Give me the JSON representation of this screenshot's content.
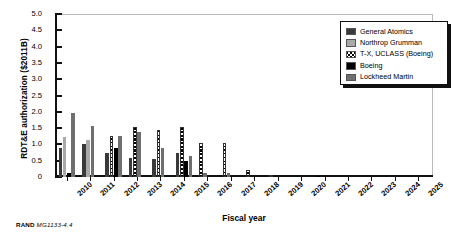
{
  "figure": {
    "caption_prefix": "RAND",
    "caption_id": "MG1133-4.4"
  },
  "legend": {
    "position": "top-right",
    "items": [
      {
        "label": "General Atomics",
        "fill": "dark-gray",
        "color": "#3a3a3a"
      },
      {
        "label": "Northrop Grumman",
        "fill": "light-gray",
        "color": "#a9a9a9"
      },
      {
        "label": "T-X, UCLASS (Boeing)",
        "fill": "crosshatch",
        "color": "#ffffff"
      },
      {
        "label": "Boeing",
        "fill": "black",
        "color": "#000000"
      },
      {
        "label": "Lockheed Martin",
        "fill": "mid-gray",
        "color": "#6f6f6f"
      }
    ]
  },
  "chart_data": {
    "type": "bar",
    "title": "",
    "xlabel": "Fiscal year",
    "ylabel": "RDT&E authorization ($2011B)",
    "ylim": [
      0,
      5.0
    ],
    "yticks": [
      "0",
      "0.5",
      "1.0",
      "1.5",
      "2.0",
      "2.5",
      "3.0",
      "3.5",
      "4.0",
      "4.5",
      "5.0"
    ],
    "grid": false,
    "legend_position": "upper right",
    "categories": [
      "2010",
      "2011",
      "2012",
      "2013",
      "2014",
      "2015",
      "2016",
      "2017",
      "2018",
      "2019",
      "2020",
      "2021",
      "2022",
      "2023",
      "2024",
      "2025"
    ],
    "series": [
      {
        "name": "General Atomics",
        "values": [
          0.88,
          1.02,
          0.75,
          0.59,
          0.55,
          0.75,
          0.0,
          0.0,
          0.0,
          0.0,
          0.0,
          0.0,
          0.0,
          0.0,
          0.0,
          0.0
        ]
      },
      {
        "name": "Northrop Grumman",
        "values": [
          1.22,
          1.13,
          0.0,
          0.0,
          0.0,
          0.0,
          0.0,
          0.0,
          0.0,
          0.0,
          0.0,
          0.0,
          0.0,
          0.0,
          0.0,
          0.0
        ]
      },
      {
        "name": "T-X, UCLASS (Boeing)",
        "values": [
          0.0,
          0.0,
          1.25,
          1.52,
          1.45,
          1.52,
          1.03,
          1.03,
          0.22,
          0.03,
          0.0,
          0.0,
          0.0,
          0.0,
          0.0,
          0.0
        ]
      },
      {
        "name": "Boeing",
        "values": [
          0.0,
          0.0,
          0.88,
          0.0,
          0.0,
          0.48,
          0.0,
          0.0,
          0.0,
          0.0,
          0.0,
          0.04,
          0.0,
          0.0,
          0.0,
          0.0
        ]
      },
      {
        "name": "Lockheed Martin",
        "values": [
          1.95,
          1.55,
          1.27,
          1.39,
          0.88,
          0.65,
          0.0,
          0.0,
          0.0,
          0.0,
          0.0,
          0.0,
          0.0,
          0.0,
          0.0,
          0.0
        ]
      }
    ],
    "minor_bars": [
      {
        "category": "2010",
        "series": "Boeing",
        "value": 0.13
      },
      {
        "category": "2011",
        "series": "Lockheed Martin",
        "value": 0.28
      },
      {
        "category": "2012",
        "series": "Lockheed Martin",
        "value": 0.19
      },
      {
        "category": "2013",
        "series": "Lockheed Martin",
        "value": 0.13
      },
      {
        "category": "2014",
        "series": "Lockheed Martin",
        "value": 0.09
      },
      {
        "category": "2015",
        "series": "Lockheed Martin",
        "value": 0.05
      },
      {
        "category": "2016",
        "series": "Lockheed Martin",
        "value": 0.13
      },
      {
        "category": "2017",
        "series": "Lockheed Martin",
        "value": 0.13
      }
    ]
  }
}
